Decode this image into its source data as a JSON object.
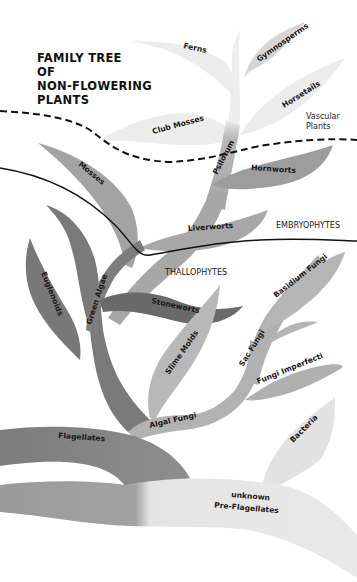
{
  "title": {
    "lines": [
      "FAMILY  TREE",
      "OF",
      "NON-FLOWERING",
      "PLANTS"
    ]
  },
  "zones": {
    "vascular": [
      "Vascular",
      "Plants"
    ],
    "embryophytes": "EMBRYOPHYTES",
    "thallophytes": "THALLOPHYTES"
  },
  "groups": {
    "ferns": "Ferns",
    "gymnosperms": "Gymnosperms",
    "horsetails": "Horsetails",
    "club_mosses": "Club Mosses",
    "psilotum": "Psilotum",
    "mosses": "Mosses",
    "hornworts": "Hornworts",
    "liverworts": "Liverworts",
    "euglenoids": "Euglenoids",
    "green_algae": "Green Algae",
    "stoneworts": "Stoneworts",
    "slime_molds": "Slime Molds",
    "basidium_fungi": "Basidium Fungi",
    "sac_fungi": "Sac Fungi",
    "fungi_imperfecti": "Fungi Imperfecti",
    "algal_fungi": "Algal Fungi",
    "bacteria": "Bacteria",
    "flagellates": "Flagellates",
    "pre_flagellates": [
      "unknown",
      "Pre-Flagellates"
    ]
  },
  "colors": {
    "vascular_tint": "#ececec",
    "embryo_tint": "#a9a9a9",
    "algae_dark": "#6f6f6f",
    "fungi_tint": "#b4b4b4",
    "pale": "#dcdcdc",
    "line": "#111111"
  }
}
